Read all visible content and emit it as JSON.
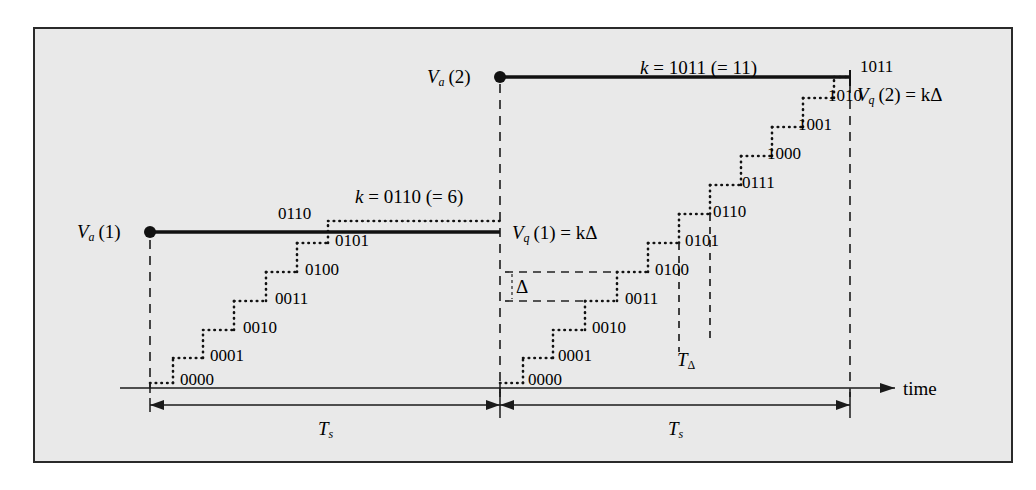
{
  "figure": {
    "type": "timing-diagram",
    "background_color": "#e9e9e9",
    "border_color": "#2a2a2a",
    "axis": {
      "x_axis_label": "time",
      "baseline_y_px": 388
    }
  },
  "labels": {
    "va1": "V",
    "va1_sub": "a",
    "va1_arg": "(1)",
    "va2": "V",
    "va2_sub": "a",
    "va2_arg": "(2)",
    "vq1": "V",
    "vq1_sub": "q",
    "vq1_rest": "(1) = kΔ",
    "vq2": "V",
    "vq2_sub": "q",
    "vq2_rest": "(2) = kΔ",
    "k1": "k = 0110 (= 6)",
    "k2": "k = 1011 (= 11)",
    "delta": "Δ",
    "t_delta": "T",
    "t_delta_sub": "Δ",
    "ts_left": "T",
    "ts_left_sub": "s",
    "ts_right": "T",
    "ts_right_sub": "s",
    "time": "time"
  },
  "chart_data": {
    "type": "line",
    "title": "",
    "xlabel": "time",
    "ylabel": "",
    "series": [
      {
        "name": "V_a(1) analog sample 1",
        "type": "held-level",
        "value_code": "0110",
        "value_decimal": 6,
        "x_start_px": 150,
        "x_end_px": 500,
        "y_px": 232
      },
      {
        "name": "V_a(2) analog sample 2",
        "type": "held-level",
        "value_code": "1011",
        "value_decimal": 11,
        "x_start_px": 500,
        "x_end_px": 850,
        "y_px": 77
      },
      {
        "name": "counter staircase, sampling period 1",
        "type": "staircase",
        "codes": [
          "0000",
          "0001",
          "0010",
          "0011",
          "0100",
          "0101",
          "0110"
        ],
        "decimals": [
          0,
          1,
          2,
          3,
          4,
          5,
          6
        ]
      },
      {
        "name": "counter staircase, sampling period 2",
        "type": "staircase",
        "codes": [
          "0000",
          "0001",
          "0010",
          "0011",
          "0100",
          "0101",
          "0110",
          "0111",
          "1000",
          "1001",
          "1010",
          "1011"
        ],
        "decimals": [
          0,
          1,
          2,
          3,
          4,
          5,
          6,
          7,
          8,
          9,
          10,
          11
        ]
      }
    ],
    "annotations": [
      {
        "text": "k = 0110 (= 6)",
        "kind": "count-result",
        "period": 1
      },
      {
        "text": "k = 1011 (= 11)",
        "kind": "count-result",
        "period": 2
      },
      {
        "text": "V_q(1) = kΔ",
        "kind": "quantized-output",
        "period": 1
      },
      {
        "text": "V_q(2) = kΔ",
        "kind": "quantized-output",
        "period": 2
      },
      {
        "text": "Δ",
        "kind": "step-size",
        "between_codes": [
          "0011",
          "0100"
        ]
      },
      {
        "text": "T_Δ",
        "kind": "step-period"
      },
      {
        "text": "T_s",
        "kind": "sampling-period",
        "period": 1
      },
      {
        "text": "T_s",
        "kind": "sampling-period",
        "period": 2
      }
    ],
    "step_codes_period1": [
      {
        "code": "0000",
        "label_x": 180,
        "label_y": 371,
        "step_y": 383,
        "x0": 150,
        "x1": 173
      },
      {
        "code": "0001",
        "label_x": 210,
        "label_y": 347,
        "step_y": 358,
        "x0": 173,
        "x1": 203
      },
      {
        "code": "0010",
        "label_x": 243,
        "label_y": 319,
        "step_y": 330,
        "x0": 203,
        "x1": 234
      },
      {
        "code": "0011",
        "label_x": 275,
        "label_y": 290,
        "step_y": 301,
        "x0": 234,
        "x1": 266
      },
      {
        "code": "0100",
        "label_x": 305,
        "label_y": 261,
        "step_y": 272,
        "x0": 266,
        "x1": 297
      },
      {
        "code": "0101",
        "label_x": 335,
        "label_y": 232,
        "step_y": 243,
        "x0": 297,
        "x1": 328
      },
      {
        "code": "0110",
        "label_x": 278,
        "label_y": 205,
        "step_y": 221,
        "x0": 328,
        "x1": 500
      }
    ],
    "step_codes_period2": [
      {
        "code": "0000",
        "label_x": 528,
        "label_y": 371,
        "step_y": 383,
        "x0": 500,
        "x1": 523
      },
      {
        "code": "0001",
        "label_x": 558,
        "label_y": 347,
        "step_y": 358,
        "x0": 523,
        "x1": 553
      },
      {
        "code": "0010",
        "label_x": 592,
        "label_y": 319,
        "step_y": 330,
        "x0": 553,
        "x1": 585
      },
      {
        "code": "0011",
        "label_x": 625,
        "label_y": 290,
        "step_y": 301,
        "x0": 585,
        "x1": 617
      },
      {
        "code": "0100",
        "label_x": 655,
        "label_y": 261,
        "step_y": 272,
        "x0": 617,
        "x1": 648
      },
      {
        "code": "0101",
        "label_x": 685,
        "label_y": 232,
        "step_y": 243,
        "x0": 648,
        "x1": 679
      },
      {
        "code": "0110",
        "label_x": 713,
        "label_y": 203,
        "step_y": 214,
        "x0": 679,
        "x1": 710
      },
      {
        "code": "0111",
        "label_x": 742,
        "label_y": 174,
        "step_y": 185,
        "x0": 710,
        "x1": 741
      },
      {
        "code": "1000",
        "label_x": 767,
        "label_y": 145,
        "step_y": 156,
        "x0": 741,
        "x1": 772
      },
      {
        "code": "1001",
        "label_x": 798,
        "label_y": 116,
        "step_y": 127,
        "x0": 772,
        "x1": 803
      },
      {
        "code": "1010",
        "label_x": 828,
        "label_y": 87,
        "step_y": 98,
        "x0": 803,
        "x1": 834
      },
      {
        "code": "1011",
        "label_x": 860,
        "label_y": 58,
        "step_y": 77,
        "x0": 834,
        "x1": 850
      }
    ]
  }
}
